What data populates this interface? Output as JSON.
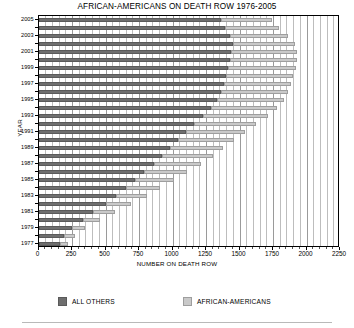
{
  "chart": {
    "title": "AFRICAN-AMERICANS ON DEATH ROW 1976-2005",
    "xlabel": "NUMBER ON DEATH ROW",
    "ylabel": "YEAR"
  },
  "legend": {
    "items": [
      {
        "label": "ALL OTHERS",
        "color": "#6e6e6e"
      },
      {
        "label": "AFRICAN-AMERICANS",
        "color": "#c9c9c9"
      }
    ]
  },
  "axis": {
    "x_ticks": [
      "0",
      "250",
      "500",
      "750",
      "1000",
      "1250",
      "1500",
      "1750",
      "2000",
      "2250"
    ],
    "y_ticks": [
      "2005",
      "2003",
      "2001",
      "1999",
      "1997",
      "1995",
      "1993",
      "1991",
      "1989",
      "1987",
      "1985",
      "1983",
      "1981",
      "1979",
      "1977"
    ]
  },
  "chart_data": {
    "type": "bar",
    "orientation": "horizontal",
    "stacked": true,
    "title": "AFRICAN-AMERICANS ON DEATH ROW 1976-2005",
    "xlabel": "NUMBER ON DEATH ROW",
    "ylabel": "YEAR",
    "xlim": [
      0,
      2250
    ],
    "xtick_step": 250,
    "grid": true,
    "legend_position": "bottom",
    "categories": [
      "2005",
      "2004",
      "2003",
      "2002",
      "2001",
      "2000",
      "1999",
      "1998",
      "1997",
      "1996",
      "1995",
      "1994",
      "1993",
      "1992",
      "1991",
      "1990",
      "1989",
      "1988",
      "1987",
      "1986",
      "1985",
      "1984",
      "1983",
      "1982",
      "1981",
      "1980",
      "1979",
      "1978",
      "1977"
    ],
    "series": [
      {
        "name": "ALL OTHERS",
        "color": "#6e6e6e",
        "values": [
          1360,
          1395,
          1430,
          1455,
          1440,
          1430,
          1415,
          1400,
          1385,
          1360,
          1330,
          1290,
          1230,
          1160,
          1100,
          1040,
          980,
          920,
          860,
          790,
          720,
          650,
          580,
          500,
          410,
          330,
          250,
          190,
          160
        ]
      },
      {
        "name": "AFRICAN-AMERICANS",
        "color": "#c9c9c9",
        "values": [
          380,
          400,
          430,
          460,
          490,
          500,
          510,
          500,
          500,
          500,
          500,
          490,
          480,
          460,
          440,
          420,
          400,
          380,
          350,
          320,
          290,
          260,
          230,
          190,
          160,
          130,
          100,
          80,
          60
        ]
      }
    ],
    "totals": [
      1740,
      1795,
      1860,
      1915,
      1930,
      1930,
      1925,
      1900,
      1885,
      1860,
      1830,
      1780,
      1710,
      1620,
      1540,
      1460,
      1380,
      1300,
      1210,
      1110,
      1010,
      910,
      810,
      690,
      570,
      460,
      350,
      270,
      220
    ]
  }
}
